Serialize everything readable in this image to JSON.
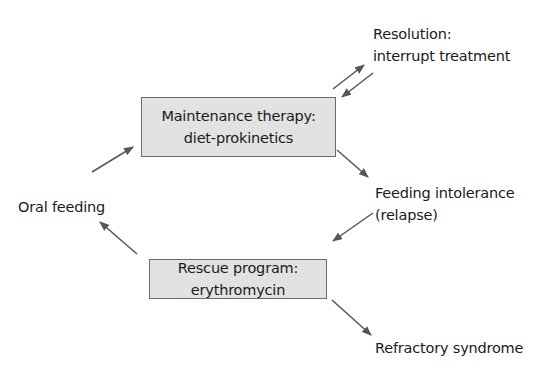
{
  "diagram": {
    "boxes": {
      "maintenance": {
        "line1": "Maintenance therapy:",
        "line2": "diet-prokinetics"
      },
      "rescue": {
        "line1": "Rescue program:",
        "line2": "erythromycin"
      }
    },
    "labels": {
      "resolution": {
        "line1": "Resolution:",
        "line2": "interrupt treatment"
      },
      "intolerance": {
        "line1": "Feeding intolerance",
        "line2": "(relapse)"
      },
      "oral": "Oral feeding",
      "refractory": "Refractory syndrome"
    },
    "colors": {
      "box_fill": "#e2e2e2",
      "box_border": "#6a6a6a",
      "arrow": "#555555",
      "text": "#1a1a1a"
    },
    "edges": [
      {
        "from": "Maintenance therapy",
        "to": "Resolution"
      },
      {
        "from": "Resolution",
        "to": "Maintenance therapy"
      },
      {
        "from": "Maintenance therapy",
        "to": "Feeding intolerance"
      },
      {
        "from": "Feeding intolerance",
        "to": "Rescue program"
      },
      {
        "from": "Rescue program",
        "to": "Oral feeding"
      },
      {
        "from": "Oral feeding",
        "to": "Maintenance therapy"
      },
      {
        "from": "Rescue program",
        "to": "Refractory syndrome"
      }
    ]
  }
}
